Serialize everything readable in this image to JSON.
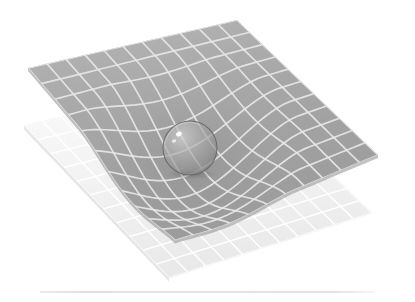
{
  "figure": {
    "name": "spacetime-curvature-illustration",
    "title": "",
    "caption": "",
    "background_color": "#ffffff",
    "canvas": {
      "width": 415,
      "height": 302
    }
  },
  "chart_data": {
    "type": "surface",
    "title": "",
    "subtitle": "",
    "xlabel": "",
    "ylabel": "",
    "grid": true,
    "legend": null,
    "annotations": [],
    "surfaces": [
      {
        "name": "curved-grid-sheet",
        "role": "deformed-spacetime-sheet",
        "fill_color": "#a9a9a9",
        "gridline_color": "#e8e8e8",
        "grid_divisions": 11,
        "opacity": 0.97,
        "corners": [
          {
            "label": "left",
            "x": 28,
            "y": 68
          },
          {
            "label": "top",
            "x": 237,
            "y": 20
          },
          {
            "label": "right",
            "x": 378,
            "y": 155
          },
          {
            "label": "bottom",
            "x": 175,
            "y": 240
          }
        ],
        "well": {
          "center_x": 190,
          "center_y": 150,
          "radius_x": 115,
          "radius_y": 95,
          "depth": 42
        }
      },
      {
        "name": "flat-grid-sheet",
        "role": "undeformed-reference-sheet",
        "fill_color": "#f4f4f4",
        "gridline_color": "#ffffff",
        "grid_divisions": 11,
        "opacity": 0.85,
        "corners": [
          {
            "label": "left",
            "x": 24,
            "y": 126
          },
          {
            "label": "top",
            "x": 231,
            "y": 78
          },
          {
            "label": "right",
            "x": 372,
            "y": 213
          },
          {
            "label": "bottom",
            "x": 169,
            "y": 278
          }
        ]
      }
    ],
    "objects": [
      {
        "name": "mass-sphere",
        "role": "massive-body",
        "shape": "sphere",
        "center_x": 190,
        "center_y": 148,
        "radius": 27,
        "fill_color": "#9a9a9a",
        "edge_color": "#5f5f5f",
        "opacity": 0.72,
        "highlights": [
          {
            "x": 179,
            "y": 134,
            "rx": 3.0,
            "ry": 2.2,
            "color": "#ffffff"
          },
          {
            "x": 174,
            "y": 141,
            "rx": 2.2,
            "ry": 1.7,
            "color": "#f2f2f2"
          }
        ],
        "shadow": {
          "center_x": 192,
          "center_y": 174,
          "rx": 26,
          "ry": 6,
          "color": "#6f6f6f",
          "opacity": 0.45
        }
      }
    ],
    "rules": [
      {
        "name": "bottom-divider",
        "orientation": "horizontal",
        "x_start": 40,
        "x_end": 375,
        "y": 292,
        "color": "#c9c9c9",
        "thickness": 1
      }
    ]
  }
}
